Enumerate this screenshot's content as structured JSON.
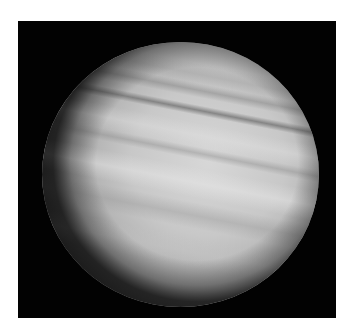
{
  "image": {
    "subject": "Banded gas giant planet in grayscale against black space",
    "icon": "planet-icon",
    "colors": {
      "border": "#ffffff",
      "space": "#020202",
      "planet_light": "#d7d7d7",
      "planet_mid": "#b4b4b4",
      "band_dark": "#8a8a8a",
      "limb_dark": "#282828"
    }
  }
}
